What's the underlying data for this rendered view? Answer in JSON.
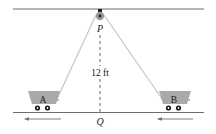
{
  "diagram": {
    "pulley_label": "P",
    "ground_point_label": "Q",
    "height_label": "12 ft",
    "cart_a_label": "A",
    "cart_b_label": "B",
    "colors": {
      "line": "#6e6e6e",
      "rope": "#c8c8c8",
      "cart_fill": "#a9a9a9",
      "wheel": "#1a1a1a",
      "pulley": "#9a9a9a",
      "text": "#222222"
    },
    "arrows": [
      {
        "name": "cart-a-motion",
        "direction": "left"
      },
      {
        "name": "cart-b-motion",
        "direction": "left"
      }
    ]
  }
}
